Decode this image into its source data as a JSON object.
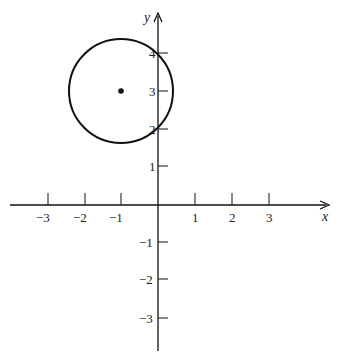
{
  "header": {
    "text": ""
  },
  "axes": {
    "x_label": "x",
    "y_label": "y",
    "x_ticks": [
      {
        "value": -3,
        "label": "−3",
        "px": 48
      },
      {
        "value": -2,
        "label": "−2",
        "px": 85
      },
      {
        "value": -1,
        "label": "−1",
        "px": 121
      },
      {
        "value": 1,
        "label": "1",
        "px": 195
      },
      {
        "value": 2,
        "label": "2",
        "px": 232
      },
      {
        "value": 3,
        "label": "3",
        "px": 269
      }
    ],
    "y_ticks": [
      {
        "value": 4,
        "label": "4",
        "py": 53
      },
      {
        "value": 3,
        "label": "3",
        "py": 91
      },
      {
        "value": 2,
        "label": "2",
        "py": 129
      },
      {
        "value": 1,
        "label": "1",
        "py": 166
      },
      {
        "value": -1,
        "label": "−1",
        "py": 242
      },
      {
        "value": -2,
        "label": "−2",
        "py": 279
      },
      {
        "value": -3,
        "label": "−3",
        "py": 318
      }
    ]
  },
  "circle": {
    "center": {
      "x": -1,
      "y": 3
    },
    "radius": 1.4,
    "stroke": "#111111"
  },
  "colors": {
    "ink": "#111111",
    "background": "#ffffff"
  }
}
